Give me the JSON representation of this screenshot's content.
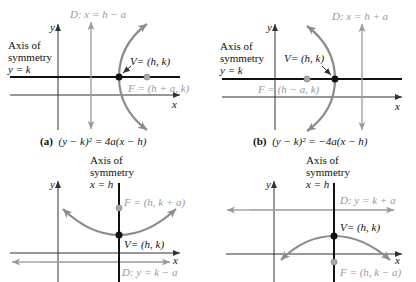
{
  "figure": {
    "colors": {
      "axis": "#333333",
      "symmetry_axis": "#111111",
      "directrix": "#9a9a9a",
      "parabola": "#8c8c8c",
      "vertex": "#111111",
      "focus": "#9a9a9a"
    },
    "panels": [
      {
        "id": "a",
        "caption_label": "(a)",
        "caption_equation": "(y − k)² = 4a(x − h)",
        "opens": "right",
        "axis_y_label": "y",
        "axis_x_label": "x",
        "symmetry_label_1": "Axis of",
        "symmetry_label_2": "symmetry",
        "symmetry_label_3": "y = k",
        "directrix_label": "D: x = h − a",
        "vertex_label": "V= (h, k)",
        "focus_label": "F = (h + a, k)"
      },
      {
        "id": "b",
        "caption_label": "(b)",
        "caption_equation": "(y − k)² = −4a(x − h)",
        "opens": "left",
        "axis_y_label": "y",
        "axis_x_label": "x",
        "symmetry_label_1": "Axis of",
        "symmetry_label_2": "symmetry",
        "symmetry_label_3": "y = k",
        "directrix_label": "D: x = h + a",
        "vertex_label": "V= (h, k)",
        "focus_label": "F = (h − a, k)"
      },
      {
        "id": "c",
        "opens": "up",
        "axis_y_label": "y",
        "axis_x_label": "x",
        "symmetry_label_1": "Axis of",
        "symmetry_label_2": "symmetry",
        "symmetry_label_3": "x = h",
        "directrix_label": "D: y = k − a",
        "vertex_label": "V= (h, k)",
        "focus_label": "F = (h, k + a)"
      },
      {
        "id": "d",
        "opens": "down",
        "axis_y_label": "y",
        "axis_x_label": "x",
        "symmetry_label_1": "Axis of",
        "symmetry_label_2": "symmetry",
        "symmetry_label_3": "x = h",
        "directrix_label": "D: y = k + a",
        "vertex_label": "V= (h, k)",
        "focus_label": "F = (h, k − a)"
      }
    ]
  }
}
